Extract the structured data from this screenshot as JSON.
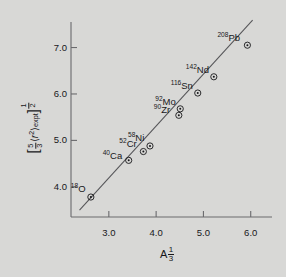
{
  "figure": {
    "background_color": "#d8d8d6",
    "foreground_color": "#17171a",
    "line_color": "#555558"
  },
  "chart_data": {
    "type": "scatter",
    "title": "",
    "xlabel": "A^1/3",
    "ylabel": "[5/3 <r^2>_expt]^1/2",
    "xlabel_base": "A",
    "xlabel_exp_num": "1",
    "xlabel_exp_den": "3",
    "ylabel_frac_num": "5",
    "ylabel_frac_den": "3",
    "ylabel_r": "r",
    "ylabel_r_exp": "2",
    "ylabel_sub": "expt",
    "ylabel_exp_num": "1",
    "ylabel_exp_den": "2",
    "xlim": [
      2.2,
      6.45
    ],
    "ylim": [
      3.35,
      7.55
    ],
    "xticks": [
      "3.0",
      "4.0",
      "5.0",
      "6.0"
    ],
    "xtick_values": [
      3.0,
      4.0,
      5.0,
      6.0
    ],
    "yticks": [
      "7.0",
      "6.0",
      "5.0",
      "4.0"
    ],
    "ytick_values": [
      7.0,
      6.0,
      5.0,
      4.0
    ],
    "grid": false,
    "legend": "none",
    "marker": "circle-dot",
    "points": [
      {
        "label_mass": "18",
        "label_elem": "O",
        "x": 2.62,
        "y": 3.78
      },
      {
        "label_mass": "40",
        "label_elem": "Ca",
        "x": 3.42,
        "y": 4.57
      },
      {
        "label_mass": "52",
        "label_elem": "Cr",
        "x": 3.73,
        "y": 4.76
      },
      {
        "label_mass": "58",
        "label_elem": "Ni",
        "x": 3.87,
        "y": 4.88
      },
      {
        "label_mass": "90",
        "label_elem": "Zr",
        "x": 4.48,
        "y": 5.54
      },
      {
        "label_mass": "92",
        "label_elem": "Mo",
        "x": 4.51,
        "y": 5.68
      },
      {
        "label_mass": "116",
        "label_elem": "Sn",
        "x": 4.88,
        "y": 6.02
      },
      {
        "label_mass": "142",
        "label_elem": "Nd",
        "x": 5.22,
        "y": 6.37
      },
      {
        "label_mass": "208",
        "label_elem": "Pb",
        "x": 5.93,
        "y": 7.05
      }
    ],
    "fit_line": {
      "x_start": 2.38,
      "y_start": 3.5,
      "x_end": 6.04,
      "y_end": 7.59
    }
  }
}
